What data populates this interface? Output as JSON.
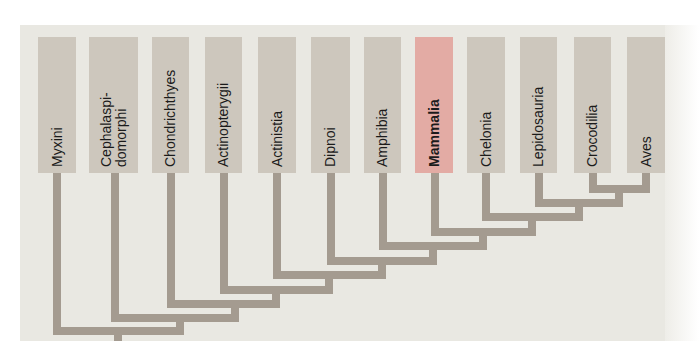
{
  "diagram": {
    "type": "cladogram",
    "branch_color": "#a49b90",
    "box_color": "#cdc7bd",
    "highlight_color": "#e3aba4",
    "background_color": "#e9e8e2",
    "highlighted_taxon": "Mammalia",
    "taxa": [
      {
        "label": "Myxini",
        "x": 38,
        "w": 38
      },
      {
        "label": "Cephalaspi-\ndomorphi",
        "x": 89,
        "w": 49
      },
      {
        "label": "Chondrichthyes",
        "x": 152,
        "w": 37
      },
      {
        "label": "Actinopterygii",
        "x": 205,
        "w": 37
      },
      {
        "label": "Actinistia",
        "x": 258,
        "w": 38
      },
      {
        "label": "Dipnoi",
        "x": 311,
        "w": 39
      },
      {
        "label": "Amphibia",
        "x": 364,
        "w": 37
      },
      {
        "label": "Mammalia",
        "x": 415,
        "w": 38,
        "highlight": true
      },
      {
        "label": "Chelonia",
        "x": 467,
        "w": 38
      },
      {
        "label": "Lepidosauria",
        "x": 520,
        "w": 37
      },
      {
        "label": "Crocodilia",
        "x": 574,
        "w": 37
      },
      {
        "label": "Aves",
        "x": 627,
        "w": 38
      }
    ],
    "topology": "(Myxini,(Cephalaspidomorphi,(Chondrichthyes,(Actinopterygii,(Actinistia,(Dipnoi,(Amphibia,(Mammalia,(Chelonia,(Lepidosauria,(Crocodilia,Aves)))))))))))"
  }
}
